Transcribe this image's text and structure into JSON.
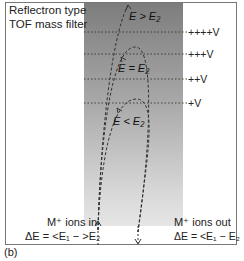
{
  "title": {
    "line1": "Reflectron type",
    "line2": "TOF mass filter"
  },
  "voltage_levels": [
    {
      "label": "++++V",
      "y": 32
    },
    {
      "label": "+++V",
      "y": 54
    },
    {
      "label": "++V",
      "y": 79
    },
    {
      "label": "+V",
      "y": 103
    }
  ],
  "trajectories": [
    {
      "label": "E > E₂",
      "apex_y": 4
    },
    {
      "label": "E = E₂",
      "apex_y": 47
    },
    {
      "label": "E < E₂",
      "apex_y": 99
    }
  ],
  "ions_in": {
    "line1": "M⁺ ions in",
    "line2": "ΔE = <E₁ − >E₂"
  },
  "ions_out": {
    "line1": "M⁺ ions out",
    "line2": "ΔE = <E₁ − E₂"
  },
  "panel_label": "(b)",
  "colors": {
    "field_top": "#7d7d7d",
    "field_bottom": "#e6e6e6",
    "line": "#333333",
    "frame": "#777777"
  }
}
